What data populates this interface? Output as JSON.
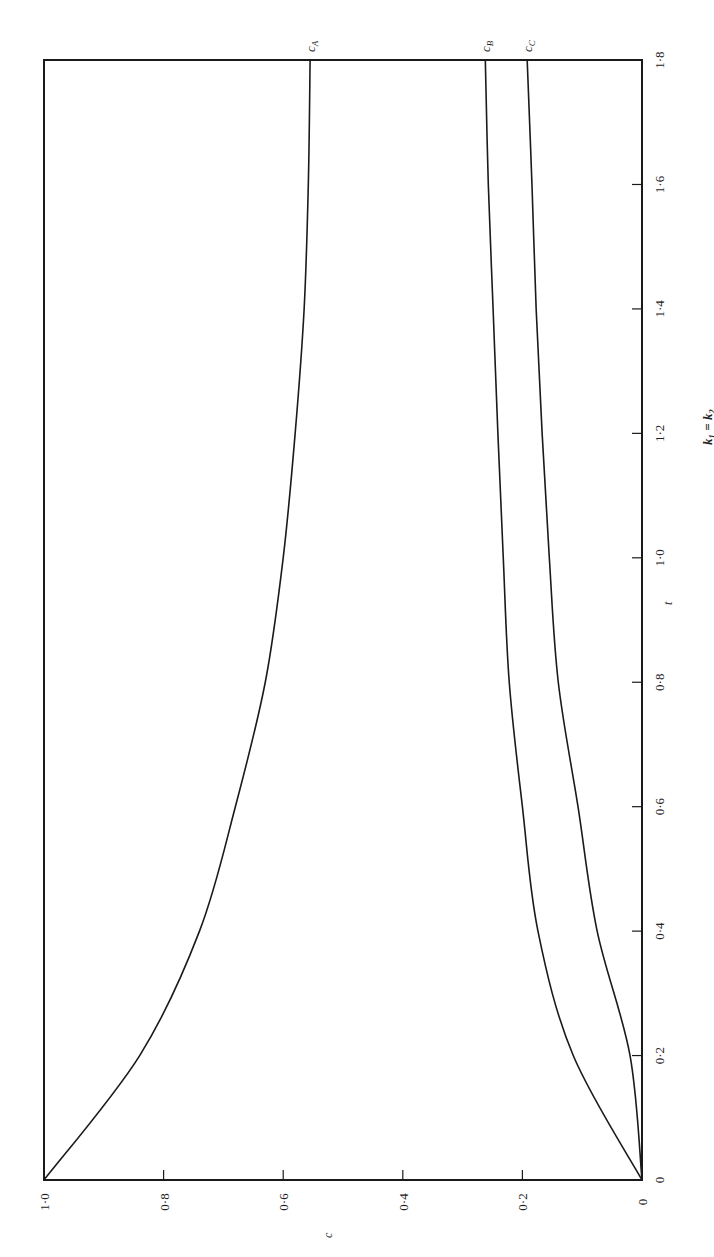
{
  "chart_data": {
    "type": "line",
    "orientation": "rotated 90 degrees counter-clockwise (t axis runs bottom-to-top on right side, c axis runs right-to-left along bottom)",
    "title": "",
    "caption_fragment": "k1 = k2",
    "xlabel": "t",
    "ylabel": "c",
    "xlim": [
      0,
      1.8
    ],
    "ylim": [
      0,
      1.0
    ],
    "x_ticks": [
      "0",
      "0·2",
      "0·4",
      "0·6",
      "0·8",
      "1·0",
      "1·2",
      "1·4",
      "1·6",
      "1·8"
    ],
    "x_tick_values": [
      0,
      0.2,
      0.4,
      0.6,
      0.8,
      1.0,
      1.2,
      1.4,
      1.6,
      1.8
    ],
    "y_ticks": [
      "0",
      "0·2",
      "0·4",
      "0·6",
      "0·8",
      "1·0"
    ],
    "y_tick_values": [
      0,
      0.2,
      0.4,
      0.6,
      0.8,
      1.0
    ],
    "grid": false,
    "legend": "inline labels at curve ends",
    "x": [
      0,
      0.2,
      0.4,
      0.6,
      0.8,
      1.0,
      1.2,
      1.4,
      1.6,
      1.8
    ],
    "series": [
      {
        "name": "cA",
        "label": "c",
        "sub": "A",
        "values": [
          1.0,
          0.84,
          0.74,
          0.68,
          0.63,
          0.6,
          0.58,
          0.565,
          0.558,
          0.555
        ]
      },
      {
        "name": "cB",
        "label": "c",
        "sub": "B",
        "values": [
          0.0,
          0.115,
          0.174,
          0.2,
          0.222,
          0.232,
          0.241,
          0.249,
          0.257,
          0.262
        ]
      },
      {
        "name": "cC",
        "label": "c",
        "sub": "C",
        "values": [
          0.0,
          0.02,
          0.075,
          0.107,
          0.14,
          0.155,
          0.167,
          0.177,
          0.184,
          0.192
        ]
      }
    ]
  },
  "labels": {
    "t_axis_title": "t",
    "c_axis_title": "c",
    "caption": "k₁ = k₂"
  }
}
